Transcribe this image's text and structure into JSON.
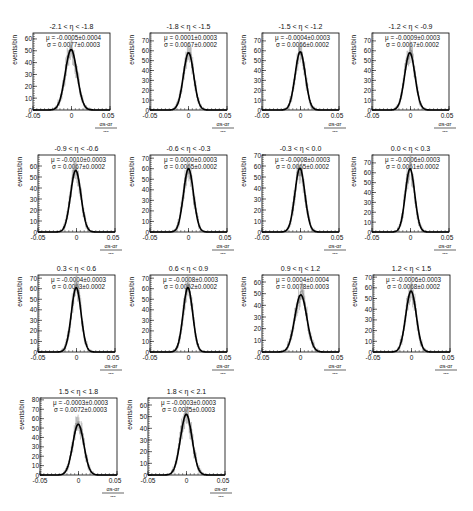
{
  "figure": {
    "ylabel": "events/bin",
    "xlabel_numerator": "α_s-α_r",
    "xlabel_denominator": "α_s",
    "xtick_labels": [
      "-0.05",
      "0",
      "0.05"
    ]
  },
  "chart_data": [
    {
      "type": "bar",
      "title": "-2.1 < η < -1.8",
      "mu": "μ = -0.0005±0.0004",
      "sigma": "σ = 0.0077±0.0003",
      "mean": -0.0005,
      "width": 0.0077,
      "peak": 51,
      "ylim": [
        0,
        65
      ],
      "yticks": [
        0,
        10,
        20,
        30,
        40,
        50,
        60
      ],
      "xlim": [
        -0.05,
        0.05
      ],
      "xlabel": "(α_s-α_r)/α_s",
      "ylabel": "events/bin"
    },
    {
      "type": "bar",
      "title": "-1.8 < η < -1.5",
      "mu": "μ = 0.0001±0.0003",
      "sigma": "σ = 0.0067±0.0002",
      "mean": 0.0001,
      "width": 0.0067,
      "peak": 58,
      "ylim": [
        0,
        78
      ],
      "yticks": [
        0,
        10,
        20,
        30,
        40,
        50,
        60,
        70
      ],
      "xlim": [
        -0.05,
        0.05
      ],
      "xlabel": "(α_s-α_r)/α_s",
      "ylabel": "events/bin"
    },
    {
      "type": "bar",
      "title": "-1.5 < η < -1.2",
      "mu": "μ = -0.0004±0.0003",
      "sigma": "σ = 0.0066±0.0002",
      "mean": -0.0004,
      "width": 0.0066,
      "peak": 59,
      "ylim": [
        0,
        78
      ],
      "yticks": [
        0,
        10,
        20,
        30,
        40,
        50,
        60,
        70
      ],
      "xlim": [
        -0.05,
        0.05
      ],
      "xlabel": "(α_s-α_r)/α_s",
      "ylabel": "events/bin"
    },
    {
      "type": "bar",
      "title": "-1.2 < η < -0.9",
      "mu": "μ = -0.0009±0.0003",
      "sigma": "σ = 0.0067±0.0002",
      "mean": -0.0009,
      "width": 0.0067,
      "peak": 58,
      "ylim": [
        0,
        78
      ],
      "yticks": [
        0,
        10,
        20,
        30,
        40,
        50,
        60,
        70
      ],
      "xlim": [
        -0.05,
        0.05
      ],
      "xlabel": "(α_s-α_r)/α_s",
      "ylabel": "events/bin"
    },
    {
      "type": "bar",
      "title": "-0.9 < η < -0.6",
      "mu": "μ = -0.0010±0.0003",
      "sigma": "σ = 0.0067±0.0002",
      "mean": -0.001,
      "width": 0.0067,
      "peak": 56,
      "ylim": [
        0,
        70
      ],
      "yticks": [
        0,
        10,
        20,
        30,
        40,
        50,
        60
      ],
      "xlim": [
        -0.05,
        0.05
      ],
      "xlabel": "(α_s-α_r)/α_s",
      "ylabel": "events/bin"
    },
    {
      "type": "bar",
      "title": "-0.6 < η < -0.3",
      "mu": "μ = 0.0000±0.0003",
      "sigma": "σ = 0.0065±0.0002",
      "mean": 0.0,
      "width": 0.0065,
      "peak": 60,
      "ylim": [
        0,
        73
      ],
      "yticks": [
        0,
        10,
        20,
        30,
        40,
        50,
        60,
        70
      ],
      "xlim": [
        -0.05,
        0.05
      ],
      "xlabel": "(α_s-α_r)/α_s",
      "ylabel": "events/bin"
    },
    {
      "type": "bar",
      "title": "-0.3 < η < 0.0",
      "mu": "μ = -0.0008±0.0003",
      "sigma": "σ = 0.0065±0.0002",
      "mean": -0.0008,
      "width": 0.0065,
      "peak": 58,
      "ylim": [
        0,
        70
      ],
      "yticks": [
        0,
        10,
        20,
        30,
        40,
        50,
        60,
        70
      ],
      "xlim": [
        -0.05,
        0.05
      ],
      "xlabel": "(α_s-α_r)/α_s",
      "ylabel": "events/bin"
    },
    {
      "type": "bar",
      "title": "0.0 < η < 0.3",
      "mu": "μ = -0.0006±0.0003",
      "sigma": "σ = 0.0061±0.0002",
      "mean": -0.0006,
      "width": 0.0061,
      "peak": 64,
      "ylim": [
        0,
        78
      ],
      "yticks": [
        0,
        10,
        20,
        30,
        40,
        50,
        60,
        70
      ],
      "xlim": [
        -0.05,
        0.05
      ],
      "xlabel": "(α_s-α_r)/α_s",
      "ylabel": "events/bin"
    },
    {
      "type": "bar",
      "title": "0.3 < η < 0.6",
      "mu": "μ = -0.0004±0.0003",
      "sigma": "σ = 0.0063±0.0002",
      "mean": -0.0004,
      "width": 0.0063,
      "peak": 61,
      "ylim": [
        0,
        73
      ],
      "yticks": [
        0,
        10,
        20,
        30,
        40,
        50,
        60,
        70
      ],
      "xlim": [
        -0.05,
        0.05
      ],
      "xlabel": "(α_s-α_r)/α_s",
      "ylabel": "events/bin"
    },
    {
      "type": "bar",
      "title": "0.6 < η < 0.9",
      "mu": "μ = -0.0008±0.0003",
      "sigma": "σ = 0.0062±0.0002",
      "mean": -0.0008,
      "width": 0.0062,
      "peak": 61,
      "ylim": [
        0,
        73
      ],
      "yticks": [
        0,
        10,
        20,
        30,
        40,
        50,
        60,
        70
      ],
      "xlim": [
        -0.05,
        0.05
      ],
      "xlabel": "(α_s-α_r)/α_s",
      "ylabel": "events/bin"
    },
    {
      "type": "bar",
      "title": "0.9 < η < 1.2",
      "mu": "μ = 0.0004±0.0004",
      "sigma": "σ = 0.0078±0.0003",
      "mean": 0.0004,
      "width": 0.0078,
      "peak": 49,
      "ylim": [
        0,
        66
      ],
      "yticks": [
        0,
        10,
        20,
        30,
        40,
        50,
        60
      ],
      "xlim": [
        -0.05,
        0.05
      ],
      "xlabel": "(α_s-α_r)/α_s",
      "ylabel": "events/bin"
    },
    {
      "type": "bar",
      "title": "1.2 < η < 1.5",
      "mu": "μ = -0.0006±0.0003",
      "sigma": "σ = 0.0068±0.0002",
      "mean": -0.0006,
      "width": 0.0068,
      "peak": 57,
      "ylim": [
        0,
        72
      ],
      "yticks": [
        0,
        10,
        20,
        30,
        40,
        50,
        60,
        70
      ],
      "xlim": [
        -0.05,
        0.05
      ],
      "xlabel": "(α_s-α_r)/α_s",
      "ylabel": "events/bin"
    },
    {
      "type": "bar",
      "title": "1.5 < η < 1.8",
      "mu": "μ = -0.0003±0.0003",
      "sigma": "σ = 0.0072±0.0003",
      "mean": -0.0003,
      "width": 0.0072,
      "peak": 54,
      "ylim": [
        0,
        82
      ],
      "yticks": [
        0,
        10,
        20,
        30,
        40,
        50,
        60,
        70,
        80
      ],
      "xlim": [
        -0.05,
        0.05
      ],
      "xlabel": "(α_s-α_r)/α_s",
      "ylabel": "events/bin"
    },
    {
      "type": "bar",
      "title": "1.8 < η < 2.1",
      "mu": "μ = -0.0003±0.0003",
      "sigma": "σ = 0.0075±0.0003",
      "mean": -0.0003,
      "width": 0.0075,
      "peak": 52,
      "ylim": [
        0,
        66
      ],
      "yticks": [
        0,
        10,
        20,
        30,
        40,
        50,
        60
      ],
      "xlim": [
        -0.05,
        0.05
      ],
      "xlabel": "(α_s-α_r)/α_s",
      "ylabel": "events/bin"
    }
  ]
}
